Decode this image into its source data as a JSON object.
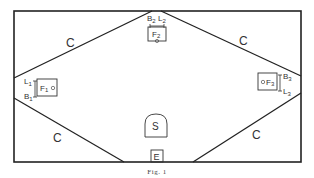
{
  "figure": {
    "caption": "Fig. 1",
    "regions": [
      "C",
      "C",
      "C",
      "C"
    ],
    "top_unit": {
      "box_label": "F",
      "box_sub": "2",
      "left_label": "B",
      "left_sub": "2",
      "right_label": "L",
      "right_sub": "2"
    },
    "left_unit": {
      "box_label": "F",
      "box_sub": "1",
      "top_label": "L",
      "top_sub": "1",
      "bottom_label": "B",
      "bottom_sub": "1"
    },
    "right_unit": {
      "box_label": "F",
      "box_sub": "3",
      "top_label": "B",
      "top_sub": "3",
      "bottom_label": "L",
      "bottom_sub": "3"
    },
    "center_label": "S",
    "entrance_label": "E"
  }
}
